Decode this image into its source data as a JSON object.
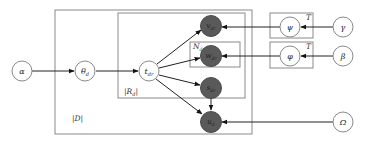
{
  "diagram": {
    "type": "plate-notation-graphical-model",
    "nodes": [
      {
        "id": "alpha",
        "label": "α",
        "observed": false
      },
      {
        "id": "theta_d",
        "label": "θd",
        "observed": false
      },
      {
        "id": "t_dr",
        "label": "tdr",
        "observed": false
      },
      {
        "id": "v_dr",
        "label": "vdr",
        "observed": true
      },
      {
        "id": "w_dr",
        "label": "wdr",
        "observed": true
      },
      {
        "id": "s_dr",
        "label": "sdr",
        "observed": true
      },
      {
        "id": "u_d",
        "label": "ud",
        "observed": true
      },
      {
        "id": "psi",
        "label": "ψ",
        "observed": false
      },
      {
        "id": "phi",
        "label": "φ",
        "observed": false
      },
      {
        "id": "gamma",
        "label": "γ",
        "observed": false
      },
      {
        "id": "beta",
        "label": "β",
        "observed": false
      },
      {
        "id": "omega",
        "label": "Ω",
        "observed": false
      }
    ],
    "plates": [
      {
        "id": "plate_D",
        "label": "|D|"
      },
      {
        "id": "plate_Rd",
        "label": "|Rd|"
      },
      {
        "id": "plate_Ndr",
        "label": "Ndr"
      },
      {
        "id": "plate_T_psi",
        "label": "T"
      },
      {
        "id": "plate_T_phi",
        "label": "T"
      }
    ],
    "edges": [
      {
        "from": "alpha",
        "to": "theta_d"
      },
      {
        "from": "theta_d",
        "to": "t_dr"
      },
      {
        "from": "t_dr",
        "to": "v_dr"
      },
      {
        "from": "t_dr",
        "to": "w_dr"
      },
      {
        "from": "t_dr",
        "to": "s_dr"
      },
      {
        "from": "t_dr",
        "to": "u_d"
      },
      {
        "from": "s_dr",
        "to": "u_d"
      },
      {
        "from": "gamma",
        "to": "psi"
      },
      {
        "from": "psi",
        "to": "v_dr"
      },
      {
        "from": "beta",
        "to": "phi"
      },
      {
        "from": "phi",
        "to": "w_dr"
      },
      {
        "from": "omega",
        "to": "u_d"
      }
    ]
  },
  "labels": {
    "alpha": "α",
    "theta": "θ",
    "theta_sub": "d",
    "t": "t",
    "t_sub": "dr",
    "v": "v",
    "v_sub": "dr",
    "w": "w",
    "w_sub": "dr",
    "s": "s",
    "s_sub": "dr",
    "u": "u",
    "u_sub": "d",
    "psi": "ψ",
    "phi": "φ",
    "gamma": "γ",
    "beta": "β",
    "omega": "Ω",
    "plate_D": "|D|",
    "plate_Rd_main": "|R",
    "plate_Rd_sub": "d",
    "plate_Rd_end": "|",
    "plate_Ndr_main": "N",
    "plate_Ndr_sub": "dr",
    "plate_T1": "T",
    "plate_T2": "T"
  }
}
